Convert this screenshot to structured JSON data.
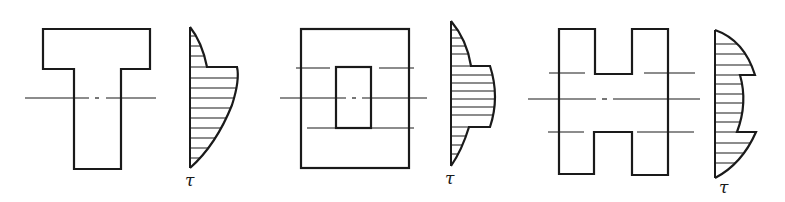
{
  "figure": {
    "panels": [
      {
        "id": "t-section",
        "section_shape": "T-section",
        "distribution_label": "τ"
      },
      {
        "id": "box-section",
        "section_shape": "hollow rectangular (box) section",
        "distribution_label": "τ"
      },
      {
        "id": "h-section",
        "section_shape": "H-section",
        "distribution_label": "τ"
      }
    ]
  }
}
